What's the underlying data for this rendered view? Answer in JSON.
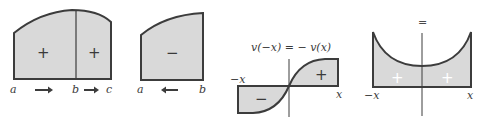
{
  "colors": {
    "fill": "#d9d9d9",
    "stroke": "#3c3c3c",
    "background": "#ffffff"
  },
  "figures": [
    {
      "id": "fig-additivity",
      "regions": [
        {
          "sign": "+"
        },
        {
          "sign": "+"
        }
      ],
      "labels": {
        "a": "a",
        "b": "b",
        "c": "c"
      },
      "arrows": [
        "arrow-right",
        "arrow-right"
      ]
    },
    {
      "id": "fig-reversed-limits",
      "regions": [
        {
          "sign": "−"
        }
      ],
      "labels": {
        "a": "a",
        "b": "b"
      },
      "arrows": [
        "arrow-left"
      ]
    },
    {
      "id": "fig-odd-function",
      "title": "v(−x) = − v(x)",
      "regions": [
        {
          "sign": "−"
        },
        {
          "sign": "+"
        }
      ],
      "labels": {
        "left": "−x",
        "right": "x"
      }
    },
    {
      "id": "fig-even-function",
      "title": "=",
      "regions": [
        {
          "sign": "+"
        },
        {
          "sign": "+"
        }
      ],
      "labels": {
        "left": "−x",
        "right": "x"
      }
    }
  ]
}
